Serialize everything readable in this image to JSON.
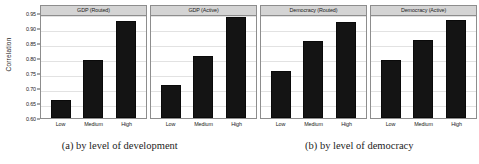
{
  "figure": {
    "ylabel": "Correlation",
    "captions": [
      {
        "id": "a",
        "text": "(a) by level of development"
      },
      {
        "id": "b",
        "text": "(b) by level of democracy"
      }
    ]
  },
  "chart_data": {
    "type": "bar",
    "title": "",
    "xlabel": "",
    "ylabel": "Correlation",
    "ylim": [
      0.6,
      0.95
    ],
    "yticks": [
      "0.60",
      "0.65",
      "0.70",
      "0.75",
      "0.80",
      "0.85",
      "0.90",
      "0.95"
    ],
    "ytick_values": [
      0.6,
      0.65,
      0.7,
      0.75,
      0.8,
      0.85,
      0.9,
      0.95
    ],
    "grid": true,
    "legend": "none",
    "categories": [
      "Low",
      "Medium",
      "High"
    ],
    "panels": [
      {
        "title": "GDP (Routed)",
        "categories": [
          "Low",
          "Medium",
          "High"
        ],
        "values": [
          0.66,
          0.793,
          0.925
        ]
      },
      {
        "title": "GDP (Active)",
        "categories": [
          "Low",
          "Medium",
          "High"
        ],
        "values": [
          0.711,
          0.806,
          0.938
        ]
      },
      {
        "title": "Democracy (Routed)",
        "categories": [
          "Low",
          "Medium",
          "High"
        ],
        "values": [
          0.756,
          0.856,
          0.921
        ]
      },
      {
        "title": "Democracy (Active)",
        "categories": [
          "Low",
          "Medium",
          "High"
        ],
        "values": [
          0.792,
          0.859,
          0.928
        ]
      }
    ],
    "colors": {
      "bar": "#141414",
      "header": "#d4d4d4",
      "grid": "#e2e2e2",
      "border": "#8d8d8d"
    }
  }
}
